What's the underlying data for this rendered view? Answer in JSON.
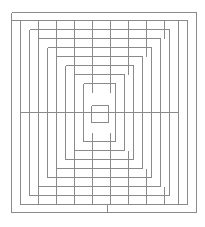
{
  "diagram": {
    "type": "maze",
    "title": "",
    "stroke_color": "#8a8a8a",
    "background": "#ffffff",
    "outer": {
      "x1": 11,
      "y1": 12,
      "x2": 196,
      "y2": 212
    },
    "top_band_y": 20,
    "right_channel_x": 187,
    "bottom_band_y": 204,
    "exit_stub": {
      "x": 107,
      "y1": 204,
      "y2": 212
    },
    "step": 9,
    "mid_y": 112,
    "center_square": {
      "x1": 91,
      "y1": 105,
      "x2": 108,
      "y2": 122
    },
    "levels": 9
  }
}
